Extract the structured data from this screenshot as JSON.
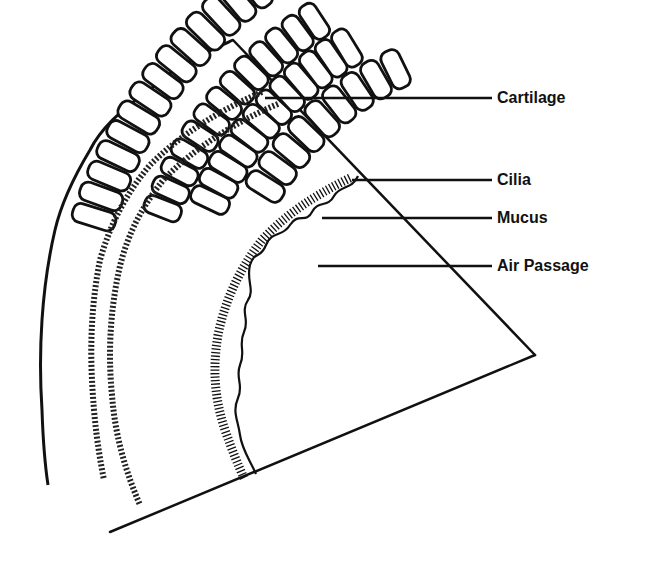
{
  "diagram": {
    "type": "cross-section illustration",
    "colors": {
      "ink": "#111111",
      "background": "#ffffff"
    },
    "labels": [
      {
        "text": "Cartilage",
        "x": 497,
        "y": 90,
        "line_from": [
          265,
          98
        ],
        "line_to": [
          492,
          98
        ]
      },
      {
        "text": "Cilia",
        "x": 497,
        "y": 172,
        "line_from": [
          352,
          180
        ],
        "line_to": [
          492,
          180
        ]
      },
      {
        "text": "Mucus",
        "x": 497,
        "y": 207,
        "line_from": [
          322,
          218
        ],
        "line_to": [
          492,
          218
        ]
      },
      {
        "text": "Air Passage",
        "x": 497,
        "y": 258,
        "line_from": [
          318,
          266
        ],
        "line_to": [
          492,
          266
        ]
      }
    ]
  }
}
